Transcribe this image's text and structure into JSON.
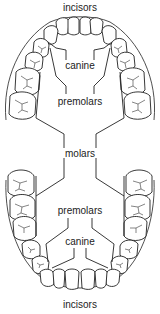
{
  "diagram": {
    "upper_jaw": {
      "labels": [
        {
          "id": "incisors",
          "text": "incisors",
          "x": 80,
          "y": 3
        },
        {
          "id": "canine",
          "text": "canine",
          "x": 80,
          "y": 64
        },
        {
          "id": "premolars",
          "text": "premolars",
          "x": 80,
          "y": 97
        }
      ]
    },
    "shared": {
      "labels": [
        {
          "id": "molars",
          "text": "molars",
          "x": 80,
          "y": 152
        }
      ]
    },
    "lower_jaw": {
      "labels": [
        {
          "id": "premolars",
          "text": "premolars",
          "x": 80,
          "y": 206
        },
        {
          "id": "canine",
          "text": "canine",
          "x": 80,
          "y": 238
        },
        {
          "id": "incisors",
          "text": "incisors",
          "x": 80,
          "y": 302
        }
      ]
    },
    "colors": {
      "line": "#222222",
      "background": "#ffffff"
    }
  }
}
